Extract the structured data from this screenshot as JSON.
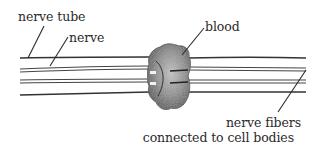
{
  "diagram": {
    "type": "labeled illustration",
    "labels": {
      "nerve_tube": "nerve tube",
      "nerve": "nerve",
      "blood": "blood",
      "nerve_fibers_line1": "nerve fibers",
      "nerve_fibers_line2": "connected to cell bodies"
    },
    "colors": {
      "ink": "#2a2a2a",
      "line": "#3a3a3a",
      "blob_dark": "#4a4a4a",
      "blob_light": "#b8b8b8",
      "background": "#ffffff"
    }
  }
}
